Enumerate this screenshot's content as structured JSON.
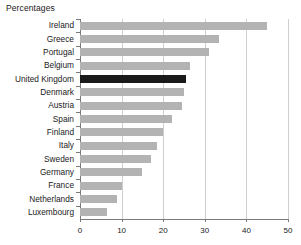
{
  "chart_data": {
    "type": "bar",
    "orientation": "horizontal",
    "title": "Percentages",
    "xlabel": "",
    "ylabel": "",
    "xlim": [
      0,
      50
    ],
    "xticks": [
      0,
      10,
      20,
      30,
      40,
      50
    ],
    "xtick_labels": [
      "0",
      "10",
      "20",
      "30",
      "40",
      "50"
    ],
    "grid": true,
    "legend": "none",
    "categories": [
      "Ireland",
      "Greece",
      "Portugal",
      "Belgium",
      "United Kingdom",
      "Denmark",
      "Austria",
      "Spain",
      "Finland",
      "Italy",
      "Sweden",
      "Germany",
      "France",
      "Netherlands",
      "Luxembourg"
    ],
    "values": [
      45,
      33.5,
      31,
      26.5,
      25.5,
      25,
      24.5,
      22,
      20,
      18.5,
      17,
      15,
      10,
      8.8,
      6.5
    ],
    "highlight_category": "United Kingdom",
    "colors": {
      "bar": "#b3b3b3",
      "bar_highlight": "#1a1a1a",
      "axis": "#7a7a7a",
      "gridline": "#cfcfcf",
      "text": "#1a1a1a",
      "background": "#ffffff"
    }
  }
}
